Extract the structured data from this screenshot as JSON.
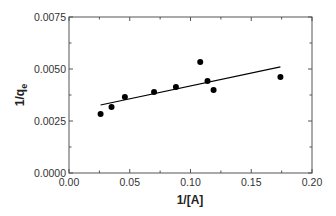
{
  "chart_data": {
    "type": "scatter",
    "title": "",
    "xlabel": "1/[A]",
    "ylabel": "1/q",
    "ylabel_subscript": "e",
    "xlim": [
      0.0,
      0.2
    ],
    "ylim": [
      0.0,
      0.0075
    ],
    "grid": false,
    "legend": null,
    "x_ticks": [
      0.0,
      0.05,
      0.1,
      0.15,
      0.2
    ],
    "x_tick_labels": [
      "0.00",
      "0.05",
      "0.10",
      "0.15",
      "0.20"
    ],
    "x_minor_ticks": [
      0.025,
      0.075,
      0.125,
      0.175
    ],
    "y_ticks": [
      0.0,
      0.0025,
      0.005,
      0.0075
    ],
    "y_tick_labels": [
      "0.0000",
      "0.0025",
      "0.0050",
      "0.0075"
    ],
    "y_minor_ticks": [
      0.00125,
      0.00375,
      0.00625
    ],
    "series": [
      {
        "name": "data",
        "type": "scatter",
        "marker": "filled-circle",
        "color": "#000000",
        "x": [
          0.026,
          0.035,
          0.046,
          0.07,
          0.088,
          0.108,
          0.114,
          0.119,
          0.174
        ],
        "y": [
          0.00284,
          0.00317,
          0.00365,
          0.00389,
          0.00413,
          0.00534,
          0.00442,
          0.00399,
          0.00462
        ]
      },
      {
        "name": "linear fit",
        "type": "line",
        "color": "#000000",
        "x": [
          0.026,
          0.174
        ],
        "y": [
          0.00327,
          0.0051
        ]
      }
    ]
  }
}
